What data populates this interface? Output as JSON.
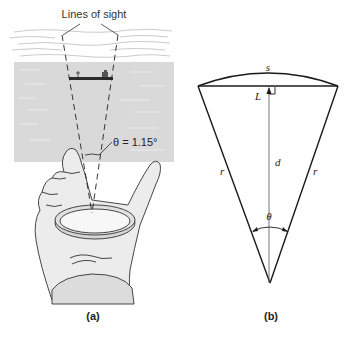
{
  "figure": {
    "panels": [
      {
        "id": "a",
        "label": "(a)",
        "annotations": {
          "lines_of_sight": "Lines of sight",
          "angle": "θ = 1.15°"
        },
        "scene": [
          "sky with clouds",
          "sea",
          "ship on horizon",
          "hand holding a ring",
          "dashed lines of sight converging at eye point"
        ]
      },
      {
        "id": "b",
        "label": "(b)",
        "annotations": {
          "arc": "s",
          "chord": "L",
          "height": "d",
          "left_side": "r",
          "right_side": "r",
          "angle": "θ"
        }
      }
    ],
    "colors": {
      "line": "#1a1a1a",
      "sea": "#d6d6d6",
      "skin": "#ebebeb",
      "sleeve": "#dcdcdc",
      "cloud": "#b8b8b8"
    }
  }
}
